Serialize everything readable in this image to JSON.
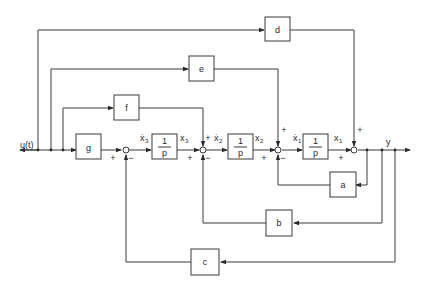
{
  "diagram": {
    "type": "block-diagram",
    "input_label": "u(t)",
    "output_label": "y",
    "blocks": {
      "a": "a",
      "b": "b",
      "c": "c",
      "d": "d",
      "e": "e",
      "f": "f",
      "g": "g"
    },
    "integrators": [
      {
        "num": "1",
        "den": "p",
        "in_label": "ẋ",
        "in_sub": "3",
        "out_label": "x",
        "out_sub": "3"
      },
      {
        "num": "1",
        "den": "p",
        "in_label": "ẋ",
        "in_sub": "2",
        "out_label": "x",
        "out_sub": "2"
      },
      {
        "num": "1",
        "den": "p",
        "in_label": "ẋ",
        "in_sub": "1",
        "out_label": "x",
        "out_sub": "1"
      }
    ],
    "signs": {
      "plus": "+",
      "minus": "−"
    }
  }
}
